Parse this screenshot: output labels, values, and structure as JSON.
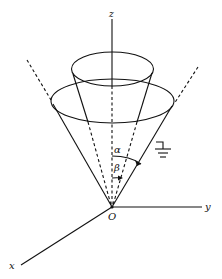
{
  "diagram": {
    "type": "geometry-figure",
    "labels": {
      "z_axis": "z",
      "y_axis": "y",
      "x_axis": "x",
      "origin": "O",
      "alpha": "α",
      "beta": "β"
    },
    "elements": [
      {
        "name": "outer-cone",
        "half_angle_label": "α",
        "grounded": true
      },
      {
        "name": "inner-cone",
        "half_angle_label": "β"
      },
      {
        "name": "ground-symbol",
        "attached_to": "outer-cone"
      }
    ],
    "colors": {
      "stroke": "#111111",
      "background": "#ffffff"
    }
  }
}
